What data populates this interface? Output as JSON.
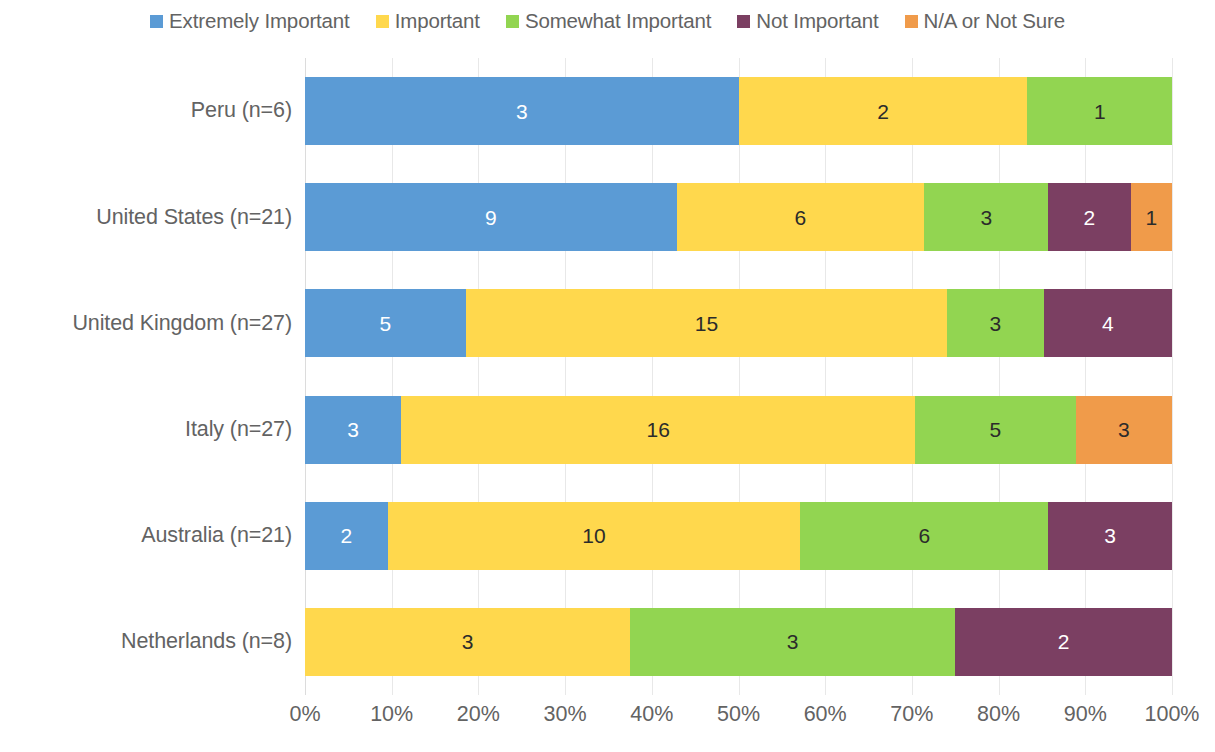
{
  "legend": {
    "items": [
      {
        "label": "Extremely Important",
        "color": "#5B9BD5",
        "icon": "legend-swatch-icon"
      },
      {
        "label": "Important",
        "color": "#FFD84D",
        "icon": "legend-swatch-icon"
      },
      {
        "label": "Somewhat Important",
        "color": "#92D551",
        "icon": "legend-swatch-icon"
      },
      {
        "label": "Not Important",
        "color": "#7B3F62",
        "icon": "legend-swatch-icon"
      },
      {
        "label": "N/A or Not Sure",
        "color": "#F09B4A",
        "icon": "legend-swatch-icon"
      }
    ]
  },
  "yaxis": {
    "labels": [
      "Peru (n=6)",
      "United States (n=21)",
      "United Kingdom (n=27)",
      "Italy (n=27)",
      "Australia (n=21)",
      "Netherlands (n=8)"
    ]
  },
  "xaxis": {
    "ticks": [
      "0%",
      "10%",
      "20%",
      "30%",
      "40%",
      "50%",
      "60%",
      "70%",
      "80%",
      "90%",
      "100%"
    ]
  },
  "chart_data": {
    "type": "bar",
    "orientation": "horizontal",
    "stacked": true,
    "normalized": true,
    "title": "",
    "subtitle": "",
    "xlabel": "",
    "ylabel": "",
    "xlim": [
      0,
      100
    ],
    "xticks": [
      0,
      10,
      20,
      30,
      40,
      50,
      60,
      70,
      80,
      90,
      100
    ],
    "xtick_labels": [
      "0%",
      "10%",
      "20%",
      "30%",
      "40%",
      "50%",
      "60%",
      "70%",
      "80%",
      "90%",
      "100%"
    ],
    "grid": true,
    "grid_axis": "x",
    "legend_position": "top",
    "value_labels": "counts",
    "categories": [
      "Peru (n=6)",
      "United States (n=21)",
      "United Kingdom (n=27)",
      "Italy (n=27)",
      "Australia (n=21)",
      "Netherlands (n=8)"
    ],
    "totals": [
      6,
      21,
      27,
      27,
      21,
      8
    ],
    "series": [
      {
        "name": "Extremely Important",
        "color": "#5B9BD5",
        "values": [
          3,
          9,
          5,
          3,
          2,
          0
        ]
      },
      {
        "name": "Important",
        "color": "#FFD84D",
        "values": [
          2,
          6,
          15,
          16,
          10,
          3
        ]
      },
      {
        "name": "Somewhat Important",
        "color": "#92D551",
        "values": [
          1,
          3,
          3,
          5,
          6,
          3
        ]
      },
      {
        "name": "Not Important",
        "color": "#7B3F62",
        "values": [
          0,
          2,
          4,
          0,
          3,
          2
        ]
      },
      {
        "name": "N/A or Not Sure",
        "color": "#F09B4A",
        "values": [
          0,
          1,
          0,
          3,
          0,
          0
        ]
      }
    ],
    "rows": [
      {
        "category": "Peru (n=6)",
        "total": 6,
        "segments": [
          {
            "series": "Extremely Important",
            "value": 3,
            "label": "3",
            "percent": 50.0,
            "color": "#5B9BD5",
            "label_color": "light"
          },
          {
            "series": "Important",
            "value": 2,
            "label": "2",
            "percent": 33.33,
            "color": "#FFD84D",
            "label_color": "dark"
          },
          {
            "series": "Somewhat Important",
            "value": 1,
            "label": "1",
            "percent": 16.67,
            "color": "#92D551",
            "label_color": "dark"
          }
        ]
      },
      {
        "category": "United States (n=21)",
        "total": 21,
        "segments": [
          {
            "series": "Extremely Important",
            "value": 9,
            "label": "9",
            "percent": 42.86,
            "color": "#5B9BD5",
            "label_color": "light"
          },
          {
            "series": "Important",
            "value": 6,
            "label": "6",
            "percent": 28.57,
            "color": "#FFD84D",
            "label_color": "dark"
          },
          {
            "series": "Somewhat Important",
            "value": 3,
            "label": "3",
            "percent": 14.29,
            "color": "#92D551",
            "label_color": "dark"
          },
          {
            "series": "Not Important",
            "value": 2,
            "label": "2",
            "percent": 9.52,
            "color": "#7B3F62",
            "label_color": "light"
          },
          {
            "series": "N/A or Not Sure",
            "value": 1,
            "label": "1",
            "percent": 4.76,
            "color": "#F09B4A",
            "label_color": "dark"
          }
        ]
      },
      {
        "category": "United Kingdom (n=27)",
        "total": 27,
        "segments": [
          {
            "series": "Extremely Important",
            "value": 5,
            "label": "5",
            "percent": 18.52,
            "color": "#5B9BD5",
            "label_color": "light"
          },
          {
            "series": "Important",
            "value": 15,
            "label": "15",
            "percent": 55.56,
            "color": "#FFD84D",
            "label_color": "dark"
          },
          {
            "series": "Somewhat Important",
            "value": 3,
            "label": "3",
            "percent": 11.11,
            "color": "#92D551",
            "label_color": "dark"
          },
          {
            "series": "Not Important",
            "value": 4,
            "label": "4",
            "percent": 14.81,
            "color": "#7B3F62",
            "label_color": "light"
          }
        ]
      },
      {
        "category": "Italy (n=27)",
        "total": 27,
        "segments": [
          {
            "series": "Extremely Important",
            "value": 3,
            "label": "3",
            "percent": 11.11,
            "color": "#5B9BD5",
            "label_color": "light"
          },
          {
            "series": "Important",
            "value": 16,
            "label": "16",
            "percent": 59.26,
            "color": "#FFD84D",
            "label_color": "dark"
          },
          {
            "series": "Somewhat Important",
            "value": 5,
            "label": "5",
            "percent": 18.52,
            "color": "#92D551",
            "label_color": "dark"
          },
          {
            "series": "N/A or Not Sure",
            "value": 3,
            "label": "3",
            "percent": 11.11,
            "color": "#F09B4A",
            "label_color": "dark"
          }
        ]
      },
      {
        "category": "Australia (n=21)",
        "total": 21,
        "segments": [
          {
            "series": "Extremely Important",
            "value": 2,
            "label": "2",
            "percent": 9.52,
            "color": "#5B9BD5",
            "label_color": "light"
          },
          {
            "series": "Important",
            "value": 10,
            "label": "10",
            "percent": 47.62,
            "color": "#FFD84D",
            "label_color": "dark"
          },
          {
            "series": "Somewhat Important",
            "value": 6,
            "label": "6",
            "percent": 28.57,
            "color": "#92D551",
            "label_color": "dark"
          },
          {
            "series": "Not Important",
            "value": 3,
            "label": "3",
            "percent": 14.29,
            "color": "#7B3F62",
            "label_color": "light"
          }
        ]
      },
      {
        "category": "Netherlands (n=8)",
        "total": 8,
        "segments": [
          {
            "series": "Important",
            "value": 3,
            "label": "3",
            "percent": 37.5,
            "color": "#FFD84D",
            "label_color": "dark"
          },
          {
            "series": "Somewhat Important",
            "value": 3,
            "label": "3",
            "percent": 37.5,
            "color": "#92D551",
            "label_color": "dark"
          },
          {
            "series": "Not Important",
            "value": 2,
            "label": "2",
            "percent": 25.0,
            "color": "#7B3F62",
            "label_color": "light"
          }
        ]
      }
    ]
  }
}
